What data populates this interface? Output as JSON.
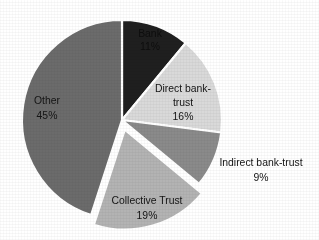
{
  "chart_data": {
    "type": "pie",
    "title": "",
    "subtitle": "",
    "xlabel": "",
    "ylabel": "",
    "legend_position": "none",
    "grid": false,
    "value_unit": "percent",
    "total": 100,
    "start_angle_deg": 0,
    "direction": "clockwise",
    "categories": [
      "Bank",
      "Direct bank-trust",
      "Indirect bank-trust",
      "Collective Trust",
      "Other"
    ],
    "values": [
      11,
      16,
      9,
      19,
      45
    ],
    "slices": [
      {
        "label": "Bank",
        "label_line1": "Bank",
        "value": 11,
        "value_text": "11%",
        "color": "#1f1f1f",
        "label_placement": "inside",
        "label_color": "#0d0d0d",
        "exploded": false
      },
      {
        "label": "Direct bank-trust",
        "label_line1": "Direct bank-",
        "label_line2": "trust",
        "value": 16,
        "value_text": "16%",
        "color": "#d9d9d9",
        "label_placement": "inside",
        "label_color": "#141414",
        "exploded": false
      },
      {
        "label": "Indirect bank-trust",
        "label_line1": "Indirect bank-trust",
        "value": 9,
        "value_text": "9%",
        "color": "#8a8a8a",
        "label_placement": "outside",
        "label_color": "#141414",
        "exploded": false
      },
      {
        "label": "Collective Trust",
        "label_line1": "Collective Trust",
        "value": 19,
        "value_text": "19%",
        "color": "#b3b3b3",
        "label_placement": "inside",
        "label_color": "#141414",
        "exploded": true
      },
      {
        "label": "Other",
        "label_line1": "Other",
        "value": 45,
        "value_text": "45%",
        "color": "#6b6b6b",
        "label_placement": "inside",
        "label_color": "#141414",
        "exploded": false
      }
    ]
  },
  "figure": {
    "background_color": "#ffffff",
    "slice_separator_color": "#ffffff",
    "center_x": 122,
    "center_y": 120,
    "radius": 100,
    "explode_offset": 10
  },
  "labels": {
    "bank_name": "Bank",
    "bank_value": "11%",
    "direct_name_l1": "Direct bank-",
    "direct_name_l2": "trust",
    "direct_value": "16%",
    "indirect_name": "Indirect bank-trust",
    "indirect_value": "9%",
    "collective_name": "Collective Trust",
    "collective_value": "19%",
    "other_name": "Other",
    "other_value": "45%"
  }
}
